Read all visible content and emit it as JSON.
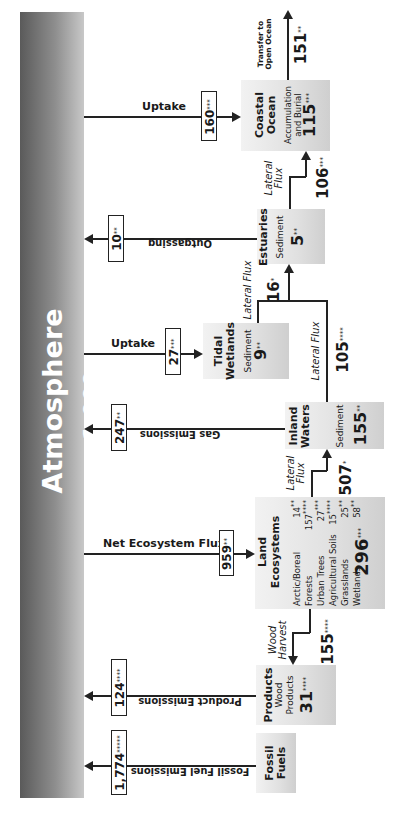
{
  "diagram": {
    "orientation": "rotated-90-ccw"
  },
  "atmosphere": {
    "label": "Atmosphere",
    "value": "1,009",
    "stars": "**"
  },
  "fluxes": {
    "fossil_emissions": {
      "label": "Fossil Fuel Emissions",
      "value": "1,774",
      "stars": "*****",
      "direction": "to-atmosphere"
    },
    "product_emissions": {
      "label": "Product Emissions",
      "value": "124",
      "stars": "****",
      "direction": "to-atmosphere"
    },
    "net_ecosystem": {
      "label": "Net Ecosystem Flux",
      "value": "959",
      "stars": "**",
      "direction": "from-atmosphere"
    },
    "gas_emissions": {
      "label": "Gas Emissions",
      "value": "247",
      "stars": "**",
      "direction": "to-atmosphere"
    },
    "tidal_uptake": {
      "label": "Uptake",
      "value": "27",
      "stars": "***",
      "direction": "from-atmosphere"
    },
    "outgassing": {
      "label": "Outgassing",
      "value": "10",
      "stars": "**",
      "direction": "to-atmosphere"
    },
    "coastal_uptake": {
      "label": "Uptake",
      "value": "160",
      "stars": "***",
      "direction": "from-atmosphere"
    },
    "wood_harvest": {
      "label1": "Wood",
      "label2": "Harvest",
      "value": "155",
      "stars": "****"
    },
    "land_to_inland": {
      "label1": "Lateral",
      "label2": "Flux",
      "value": "507",
      "stars": "*"
    },
    "inland_lateral": {
      "label": "Lateral Flux",
      "value": "105",
      "stars": "****"
    },
    "to_estuaries": {
      "label": "Lateral Flux",
      "value": "16",
      "stars": "*"
    },
    "estuary_to_coastal": {
      "label1": "Lateral",
      "label2": "Flux",
      "value": "106",
      "stars": "***"
    },
    "open_ocean": {
      "label1": "Transfer to",
      "label2": "Open Ocean",
      "value": "151",
      "stars": "**"
    }
  },
  "nodes": {
    "fossil": {
      "title1": "Fossil",
      "title2": "Fuels"
    },
    "products": {
      "title": "Products",
      "sub1": "Wood",
      "sub2": "Products",
      "value": "31",
      "stars": "****"
    },
    "land": {
      "title1": "Land",
      "title2": "Ecosystems",
      "rows": [
        {
          "name": "Arctic/Boreal",
          "value": "14",
          "stars": "**"
        },
        {
          "name": "Forests",
          "value": "157",
          "stars": "****"
        },
        {
          "name": "Urban Trees",
          "value": "27",
          "stars": "***"
        },
        {
          "name": "Agricultural Soils",
          "value": "15",
          "stars": "****"
        },
        {
          "name": "Grasslands",
          "value": "25",
          "stars": "**"
        },
        {
          "name": "Wetlands",
          "value": "58",
          "stars": "**"
        }
      ],
      "total": "296",
      "total_stars": "***"
    },
    "inland": {
      "title1": "Inland",
      "title2": "Waters",
      "sub": "Sediment",
      "value": "155",
      "stars": "**"
    },
    "tidal": {
      "title1": "Tidal",
      "title2": "Wetlands",
      "sub": "Sediment",
      "value": "9",
      "stars": "**"
    },
    "estuaries": {
      "title": "Estuaries",
      "sub": "Sediment",
      "value": "5",
      "stars": "**"
    },
    "coastal": {
      "title1": "Coastal",
      "title2": "Ocean",
      "sub1": "Accumulation",
      "sub2": "and Burial",
      "value": "115",
      "stars": "***"
    }
  }
}
